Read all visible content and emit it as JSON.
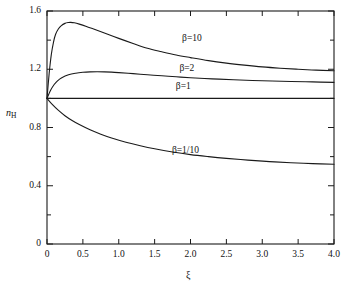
{
  "chart_data": {
    "type": "line",
    "title": "",
    "xlabel": "ξ",
    "ylabel_main": "n",
    "ylabel_sub": "H",
    "xlim": [
      0,
      4.0
    ],
    "ylim": [
      0,
      1.6
    ],
    "grid": false,
    "legend_position": "inline-annotations",
    "xticks": [
      "0",
      "0.5",
      "1.0",
      "1.5",
      "2.0",
      "2.5",
      "3.0",
      "3.5",
      "4.0"
    ],
    "xtick_values": [
      0,
      0.5,
      1.0,
      1.5,
      2.0,
      2.5,
      3.0,
      3.5,
      4.0
    ],
    "yticks": [
      "0",
      "0.4",
      "0.8",
      "1.2",
      "1.6"
    ],
    "ytick_values": [
      0,
      0.4,
      0.8,
      1.2,
      1.6
    ],
    "yminor_values": [
      0.2,
      0.6,
      1.0,
      1.4
    ],
    "series": [
      {
        "name": "β=10",
        "label_x": 2.02,
        "label_y": 1.405,
        "x": [
          0,
          0.03,
          0.06,
          0.09,
          0.12,
          0.16,
          0.2,
          0.25,
          0.3,
          0.33,
          0.38,
          0.45,
          0.55,
          0.65,
          0.8,
          1.0,
          1.2,
          1.4,
          1.6,
          1.8,
          2.0,
          2.25,
          2.5,
          2.75,
          3.0,
          3.25,
          3.5,
          3.75,
          4.0
        ],
        "y": [
          1.0,
          1.17,
          1.3,
          1.385,
          1.44,
          1.478,
          1.5,
          1.515,
          1.521,
          1.522,
          1.519,
          1.51,
          1.494,
          1.476,
          1.449,
          1.412,
          1.377,
          1.344,
          1.32,
          1.298,
          1.28,
          1.259,
          1.242,
          1.228,
          1.216,
          1.207,
          1.2,
          1.194,
          1.19
        ]
      },
      {
        "name": "β=2",
        "label_x": 1.95,
        "label_y": 1.205,
        "x": [
          0,
          0.05,
          0.1,
          0.15,
          0.2,
          0.3,
          0.4,
          0.5,
          0.6,
          0.7,
          0.8,
          0.9,
          1.0,
          1.2,
          1.4,
          1.6,
          1.8,
          2.0,
          2.3,
          2.6,
          3.0,
          3.4,
          3.7,
          4.0
        ],
        "y": [
          1.0,
          1.055,
          1.095,
          1.122,
          1.14,
          1.162,
          1.173,
          1.179,
          1.182,
          1.183,
          1.182,
          1.18,
          1.177,
          1.17,
          1.162,
          1.155,
          1.148,
          1.142,
          1.134,
          1.128,
          1.121,
          1.116,
          1.113,
          1.11
        ]
      },
      {
        "name": "β=1",
        "label_x": 1.9,
        "label_y": 1.075,
        "x": [
          0,
          0.5,
          1.0,
          1.5,
          2.0,
          2.5,
          3.0,
          3.5,
          4.0
        ],
        "y": [
          1.0,
          1.0,
          1.0,
          1.0,
          1.0,
          1.0,
          1.0,
          1.0,
          1.0
        ]
      },
      {
        "name": "β=1/10",
        "label_x": 1.93,
        "label_y": 0.638,
        "x": [
          0,
          0.08,
          0.16,
          0.25,
          0.35,
          0.45,
          0.6,
          0.75,
          0.9,
          1.1,
          1.3,
          1.5,
          1.75,
          2.0,
          2.25,
          2.5,
          2.8,
          3.1,
          3.4,
          3.7,
          4.0
        ],
        "y": [
          1.0,
          0.955,
          0.917,
          0.881,
          0.848,
          0.82,
          0.784,
          0.754,
          0.728,
          0.699,
          0.675,
          0.654,
          0.632,
          0.614,
          0.6,
          0.588,
          0.576,
          0.566,
          0.558,
          0.552,
          0.548
        ]
      }
    ]
  },
  "style": {
    "axis_color": "#1a1a1a",
    "curve_color": "#1a1a1a",
    "background": "#ffffff"
  }
}
